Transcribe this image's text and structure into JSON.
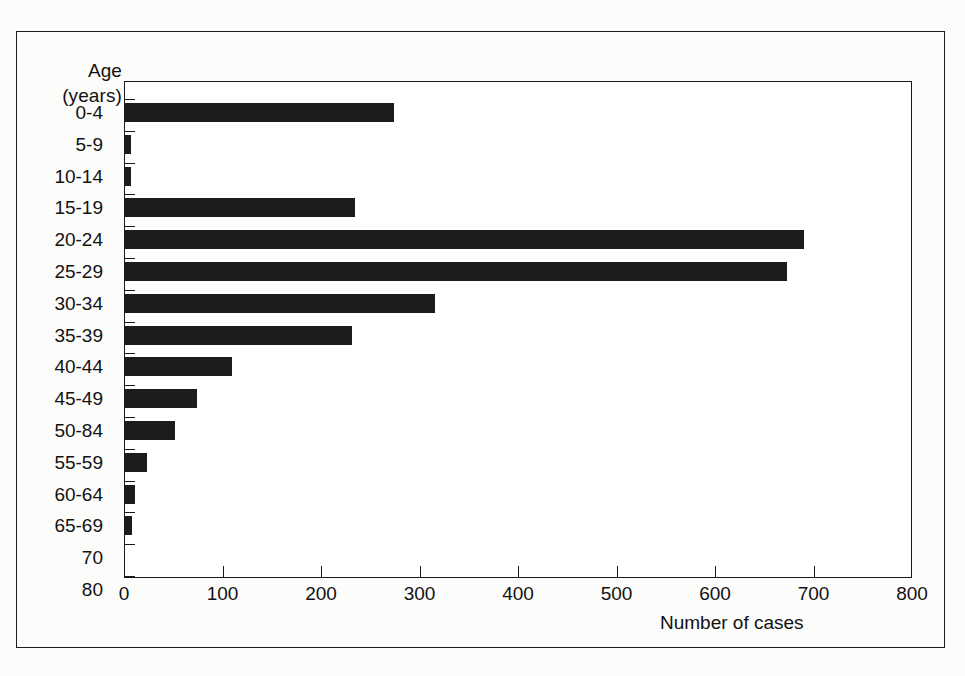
{
  "figure": {
    "y_axis_title_line1": "Age",
    "y_axis_title_line2": "(years)",
    "x_axis_title": "Number of cases"
  },
  "chart_data": {
    "type": "bar",
    "orientation": "horizontal",
    "title": "",
    "xlabel": "Number of cases",
    "ylabel": "Age (years)",
    "xlim": [
      0,
      800
    ],
    "xticks": [
      0,
      100,
      200,
      300,
      400,
      500,
      600,
      700,
      800
    ],
    "xtick_labels": [
      "0",
      "100",
      "200",
      "300",
      "400",
      "500",
      "600",
      "700",
      "800"
    ],
    "grid": false,
    "legend": false,
    "bar_color": "#1c1c1c",
    "categories": [
      "0-4",
      "5-9",
      "10-14",
      "15-19",
      "20-24",
      "25-29",
      "30-34",
      "35-39",
      "40-44",
      "45-49",
      "50-84",
      "55-59",
      "60-64",
      "65-69",
      "70",
      "80"
    ],
    "values": [
      274,
      7,
      7,
      235,
      690,
      673,
      316,
      231,
      110,
      74,
      52,
      23,
      11,
      8,
      0,
      0
    ]
  }
}
